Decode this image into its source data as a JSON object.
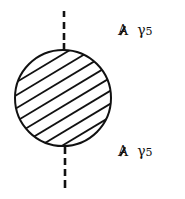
{
  "diagram": {
    "type": "feynman-vertex-blob",
    "blob": {
      "shape": "circle",
      "fill": "hatched",
      "stroke": "#111111"
    },
    "external_lines": [
      {
        "position": "top",
        "style": "dashed"
      },
      {
        "position": "bottom",
        "style": "dashed"
      }
    ],
    "vertex_labels": {
      "top": {
        "slashed": "A",
        "gamma": "γ",
        "index": "5"
      },
      "bottom": {
        "slashed": "A",
        "gamma": "γ",
        "index": "5"
      }
    }
  }
}
